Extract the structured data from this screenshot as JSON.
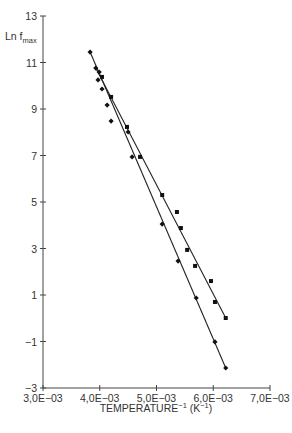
{
  "chart_data": {
    "type": "scatter",
    "title": "",
    "xlabel": "TEMPERATURE⁻¹ (K⁻¹)",
    "ylabel": "Ln f_max",
    "xlim": [
      0.003,
      0.007
    ],
    "ylim": [
      -3,
      13
    ],
    "x_ticks": [
      0.003,
      0.004,
      0.005,
      0.006,
      0.007
    ],
    "x_tick_labels": [
      "3,0E−03",
      "4,0E−03",
      "5,0E−03",
      "6,0E−03",
      "7,0E−03"
    ],
    "y_ticks": [
      13,
      11,
      9,
      7,
      5,
      3,
      1,
      -1,
      -3
    ],
    "y_tick_labels": [
      "13",
      "11",
      "9",
      "7",
      "5",
      "3",
      "1",
      "−1",
      "−3"
    ],
    "grid": false,
    "legend": null,
    "series": [
      {
        "name": "Series A (steeper, diamond markers)",
        "marker": "diamond",
        "points": [
          [
            0.00383,
            11.45
          ],
          [
            0.00393,
            10.76
          ],
          [
            0.00399,
            10.59
          ],
          [
            0.00397,
            10.25
          ],
          [
            0.00404,
            9.86
          ],
          [
            0.00413,
            9.17
          ],
          [
            0.0042,
            8.48
          ],
          [
            0.0045,
            8.01
          ],
          [
            0.00457,
            6.94
          ],
          [
            0.0051,
            4.05
          ],
          [
            0.00538,
            2.46
          ],
          [
            0.0057,
            0.87
          ],
          [
            0.00603,
            -1.02
          ],
          [
            0.00622,
            -2.14
          ]
        ],
        "fit_line": [
          [
            0.00383,
            11.45
          ],
          [
            0.00622,
            -2.14
          ]
        ]
      },
      {
        "name": "Series B (shallower, square markers)",
        "marker": "square",
        "points": [
          [
            0.00404,
            10.38
          ],
          [
            0.0042,
            9.52
          ],
          [
            0.00448,
            8.23
          ],
          [
            0.00471,
            6.94
          ],
          [
            0.0051,
            5.3
          ],
          [
            0.00536,
            4.57
          ],
          [
            0.00543,
            3.88
          ],
          [
            0.00554,
            2.94
          ],
          [
            0.00568,
            2.25
          ],
          [
            0.00596,
            1.6
          ],
          [
            0.00603,
            0.7
          ],
          [
            0.00622,
            0.01
          ]
        ],
        "fit_line": [
          [
            0.00393,
            10.76
          ],
          [
            0.00622,
            0.01
          ]
        ]
      }
    ]
  },
  "axes": {
    "ylabel_main": "Ln f",
    "ylabel_sub": "max",
    "xlabel_main": "TEMPERATURE",
    "xlabel_sup1": "−1",
    "xlabel_unit_open": " (K",
    "xlabel_sup2": "−1",
    "xlabel_unit_close": ")"
  }
}
